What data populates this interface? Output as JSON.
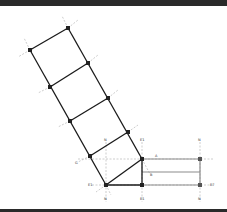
{
  "diagram": {
    "title": "",
    "colors": {
      "member": "#1a1a1a",
      "secondary": "#8c8c8c",
      "guide": "#9a9a9a",
      "node": "#222222",
      "bar": "#2a2a2a"
    },
    "nodes": [
      {
        "id": "L1",
        "x": 30,
        "y": 50,
        "label": "A"
      },
      {
        "id": "R1",
        "x": 68,
        "y": 28,
        "label": "B"
      },
      {
        "id": "L2",
        "x": 50,
        "y": 87,
        "label": "C"
      },
      {
        "id": "R2",
        "x": 88,
        "y": 63,
        "label": "D"
      },
      {
        "id": "L3",
        "x": 70,
        "y": 121,
        "label": "E"
      },
      {
        "id": "R3",
        "x": 108,
        "y": 98,
        "label": "F"
      },
      {
        "id": "L4",
        "x": 90,
        "y": 156,
        "label": "G"
      },
      {
        "id": "R4",
        "x": 128,
        "y": 132,
        "label": "H"
      },
      {
        "id": "P",
        "x": 106,
        "y": 185,
        "label": "N1"
      },
      {
        "id": "Q",
        "x": 142,
        "y": 159,
        "label": "E1"
      },
      {
        "id": "S",
        "x": 142,
        "y": 185,
        "label": "N2"
      },
      {
        "id": "T",
        "x": 200,
        "y": 159,
        "label": "N3"
      },
      {
        "id": "U",
        "x": 200,
        "y": 185,
        "label": "E2"
      }
    ],
    "labels": {
      "top_guide_1": "N",
      "top_guide_2": "E1",
      "top_guide_3": "N",
      "bottom_guide_1": "N",
      "bottom_guide_2": "E1",
      "bottom_guide_3": "N",
      "mid_a": "A",
      "mid_b": "B",
      "right_e": "E7",
      "left_g": "G",
      "p_label": "E1"
    }
  }
}
